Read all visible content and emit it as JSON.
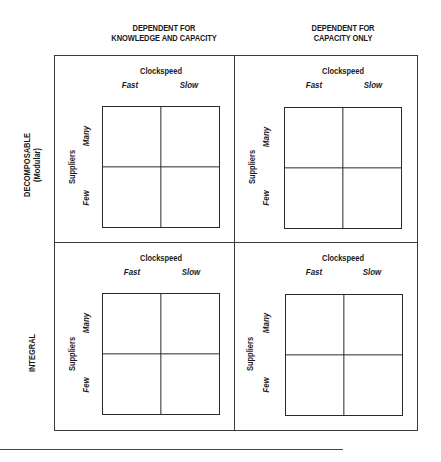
{
  "columns": [
    {
      "line1": "DEPENDENT FOR",
      "line2": "KNOWLEDGE AND CAPACITY"
    },
    {
      "line1": "DEPENDENT FOR",
      "line2": "CAPACITY ONLY"
    }
  ],
  "rows": [
    {
      "line1": "DECOMPOSABLE",
      "line2": "(Modular)"
    },
    {
      "line1": "INTEGRAL",
      "line2": ""
    }
  ],
  "quadrant_labels": {
    "x_axis_title": "Clockspeed",
    "x_axis_left": "Fast",
    "x_axis_right": "Slow",
    "y_axis_title": "Suppliers",
    "y_axis_top": "Many",
    "y_axis_bottom": "Few"
  },
  "quadrants": [
    {
      "position": "top-left",
      "column": "Dependent for knowledge and capacity",
      "row": "Decomposable (Modular)",
      "cells": [
        "Fast/Many",
        "Slow/Many",
        "Fast/Few",
        "Slow/Few"
      ]
    },
    {
      "position": "top-right",
      "column": "Dependent for capacity only",
      "row": "Decomposable (Modular)",
      "cells": [
        "Fast/Many",
        "Slow/Many",
        "Fast/Few",
        "Slow/Few"
      ]
    },
    {
      "position": "bottom-left",
      "column": "Dependent for knowledge and capacity",
      "row": "Integral",
      "cells": [
        "Fast/Many",
        "Slow/Many",
        "Fast/Few",
        "Slow/Few"
      ]
    },
    {
      "position": "bottom-right",
      "column": "Dependent for capacity only",
      "row": "Integral",
      "cells": [
        "Fast/Many",
        "Slow/Many",
        "Fast/Few",
        "Slow/Few"
      ]
    }
  ],
  "colors": {
    "line": "#2a2a2a",
    "text": "#1a1a1a",
    "background": "#ffffff"
  }
}
